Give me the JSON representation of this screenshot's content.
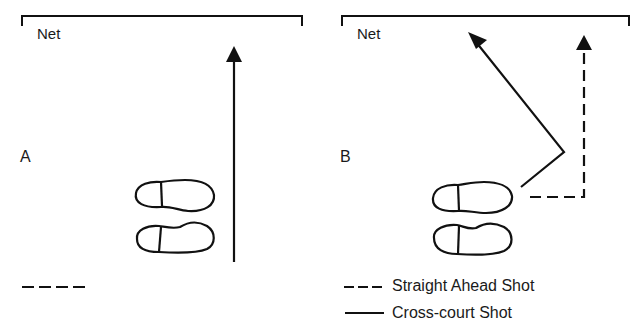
{
  "panel_a": {
    "letter": "A",
    "net_label": "Net",
    "legend_fragment": "dashed-line-only"
  },
  "panel_b": {
    "letter": "B",
    "net_label": "Net",
    "legend": [
      {
        "style": "dashed",
        "label": "Straight Ahead Shot"
      },
      {
        "style": "solid",
        "label": "Cross-court Shot"
      }
    ]
  },
  "colors": {
    "ink": "#111111",
    "background": "#ffffff"
  }
}
